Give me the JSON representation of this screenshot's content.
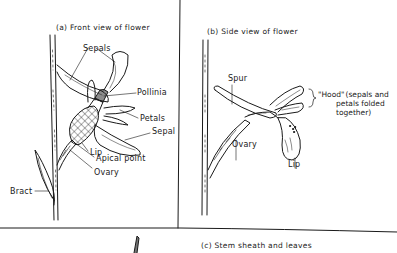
{
  "panels": {
    "a": {
      "caption": "(a)  Front view of flower",
      "labels": {
        "sepals": "Sepals",
        "pollinia": "Pollinia",
        "petals": "Petals",
        "sepal": "Sepal",
        "lip": "Lip",
        "apical_point": "Apical point",
        "ovary": "Ovary",
        "bract": "Bract"
      }
    },
    "b": {
      "caption": "(b)  Side view of flower",
      "labels": {
        "spur": "Spur",
        "hood": "\"Hood\"",
        "hood_note_1": "(sepals and",
        "hood_note_2": "petals folded",
        "hood_note_3": "together)",
        "ovary": "Ovary",
        "lip": "Lip"
      }
    },
    "c": {
      "caption": "(c)  Stem sheath and leaves"
    }
  },
  "colors": {
    "ink": "#1a1a1a",
    "paper": "#ffffff"
  }
}
